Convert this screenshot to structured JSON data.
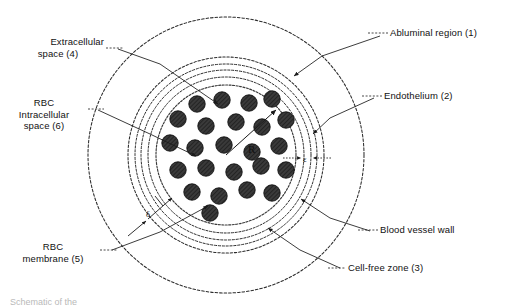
{
  "figure": {
    "type": "schematic-cross-section",
    "caption_partial": "Schematic of the"
  },
  "labels": {
    "abluminal": {
      "text": "Abluminal region (1)",
      "lines": [
        "Abluminal region (1)"
      ]
    },
    "endothelium": {
      "text": "Endothelium (2)",
      "lines": [
        "Endothelium (2)"
      ]
    },
    "vessel_wall": {
      "text": "Blood vessel wall",
      "lines": [
        "Blood vessel wall"
      ]
    },
    "cell_free": {
      "text": "Cell-free zone (3)",
      "lines": [
        "Cell-free zone (3)"
      ]
    },
    "extracellular": {
      "text": "Extracellular space (4)",
      "line1": "Extracellular",
      "line2": "space (4)"
    },
    "rbc_intracellular": {
      "text": "RBC Intracellular space (6)",
      "line1": "RBC",
      "line2": "Intracellular",
      "line3": "space (6)"
    },
    "rbc_membrane": {
      "text": "RBC membrane (5)",
      "line1": "RBC",
      "line2": "membrane (5)"
    }
  },
  "annotations": {
    "radius": {
      "symbol": "R",
      "meaning": "vessel lumen radius"
    },
    "endothelium_thickness": {
      "symbol": "ε",
      "meaning": "endothelium thickness"
    },
    "cellfree_thickness": {
      "symbol": "δ",
      "meaning": "cell-free zone thickness"
    }
  },
  "geometry": {
    "center": {
      "x": 226,
      "y": 155
    },
    "radii": {
      "abluminal_outer": 138,
      "vessel_wall_outer": 98,
      "endothelium_outer": 91,
      "endothelium_inner": 85,
      "cellfree_outer": 78,
      "rbc_core": 70
    }
  },
  "colors": {
    "ink": "#1a1a1a",
    "rbc_fill": "#3a3a3a",
    "background": "#ffffff"
  },
  "rbc_cells": {
    "count": 24,
    "radius": 8.2,
    "positions": [
      {
        "x": 197,
        "y": 104
      },
      {
        "x": 222,
        "y": 100
      },
      {
        "x": 249,
        "y": 103
      },
      {
        "x": 272,
        "y": 99
      },
      {
        "x": 178,
        "y": 119
      },
      {
        "x": 206,
        "y": 126
      },
      {
        "x": 236,
        "y": 122
      },
      {
        "x": 262,
        "y": 127
      },
      {
        "x": 286,
        "y": 120
      },
      {
        "x": 170,
        "y": 143
      },
      {
        "x": 195,
        "y": 148
      },
      {
        "x": 224,
        "y": 145
      },
      {
        "x": 252,
        "y": 152
      },
      {
        "x": 279,
        "y": 146
      },
      {
        "x": 178,
        "y": 170
      },
      {
        "x": 206,
        "y": 168
      },
      {
        "x": 234,
        "y": 172
      },
      {
        "x": 261,
        "y": 166
      },
      {
        "x": 286,
        "y": 170
      },
      {
        "x": 192,
        "y": 192
      },
      {
        "x": 219,
        "y": 196
      },
      {
        "x": 247,
        "y": 190
      },
      {
        "x": 272,
        "y": 193
      },
      {
        "x": 210,
        "y": 213
      }
    ]
  }
}
